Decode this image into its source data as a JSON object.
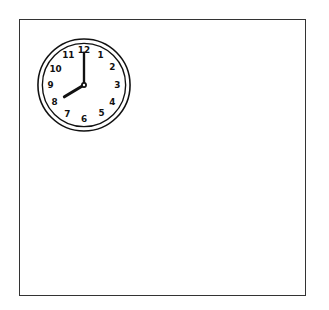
{
  "clock": {
    "time_shown": "8:00",
    "hour": 8,
    "minute": 0,
    "numerals": [
      "12",
      "1",
      "2",
      "3",
      "4",
      "5",
      "6",
      "7",
      "8",
      "9",
      "10",
      "11"
    ],
    "stroke_color": "#111111"
  },
  "frame": {
    "border_color": "#333333",
    "background": "#ffffff"
  }
}
